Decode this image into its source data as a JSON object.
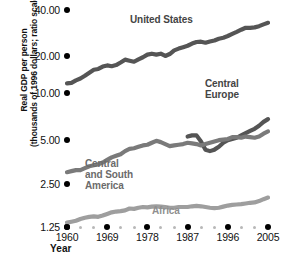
{
  "chart_data": {
    "type": "line",
    "title": "",
    "xlabel": "Year",
    "ylabel_line1": "Real GDP per person",
    "ylabel_line2": "(thousands of 1996 dollars; ratio scale)",
    "yscale": "log",
    "ylim": [
      1.25,
      45.0
    ],
    "xlim": [
      1960,
      2005
    ],
    "yticks": [
      40.0,
      20.0,
      10.0,
      5.0,
      2.5,
      1.25
    ],
    "ytick_labels": [
      "40.00",
      "20.00",
      "10.00",
      "5.00",
      "2.50",
      "1.25"
    ],
    "xticks_major": [
      1960,
      1969,
      1978,
      1987,
      1996,
      2005
    ],
    "xtick_labels": [
      "1960",
      "1969",
      "1978",
      "1987",
      "1996",
      "2005"
    ],
    "xticks_minor_per_interval": 2,
    "grid": false,
    "legend": "inline-annotations",
    "series": [
      {
        "name": "United States",
        "color": "#555555",
        "label_x": 1978,
        "label_y": 30.0,
        "x": [
          1960,
          1961,
          1962,
          1963,
          1964,
          1965,
          1966,
          1967,
          1968,
          1969,
          1970,
          1971,
          1972,
          1973,
          1974,
          1975,
          1976,
          1977,
          1978,
          1979,
          1980,
          1981,
          1982,
          1983,
          1984,
          1985,
          1986,
          1987,
          1988,
          1989,
          1990,
          1991,
          1992,
          1993,
          1994,
          1995,
          1996,
          1997,
          1998,
          1999,
          2000,
          2001,
          2002,
          2003,
          2004,
          2005
        ],
        "values": [
          12.4,
          12.5,
          13.0,
          13.4,
          14.0,
          14.7,
          15.4,
          15.6,
          16.2,
          16.5,
          16.3,
          16.6,
          17.3,
          18.1,
          17.8,
          17.5,
          18.2,
          18.8,
          19.6,
          19.9,
          19.6,
          19.9,
          19.2,
          19.8,
          21.0,
          21.6,
          22.1,
          22.6,
          23.4,
          24.0,
          24.1,
          23.7,
          24.2,
          24.6,
          25.3,
          25.7,
          26.4,
          27.3,
          28.2,
          29.2,
          30.1,
          30.1,
          30.3,
          30.9,
          31.8,
          32.6
        ]
      },
      {
        "name": "Central Europe",
        "color": "#555555",
        "label_x": 1990,
        "label_y": 9.2,
        "x": [
          1987,
          1988,
          1989,
          1990,
          1991,
          1992,
          1993,
          1994,
          1995,
          1996,
          1997,
          1998,
          1999,
          2000,
          2001,
          2002,
          2003,
          2004,
          2005
        ],
        "values": [
          5.3,
          5.4,
          5.4,
          4.9,
          4.3,
          4.2,
          4.3,
          4.5,
          4.8,
          5.0,
          5.1,
          5.2,
          5.4,
          5.6,
          5.8,
          6.0,
          6.3,
          6.7,
          7.0
        ]
      },
      {
        "name": "Central and South America",
        "color": "#7a7a7a",
        "label_x": 1968,
        "label_y": 3.1,
        "x": [
          1960,
          1961,
          1962,
          1963,
          1964,
          1965,
          1966,
          1967,
          1968,
          1969,
          1970,
          1971,
          1972,
          1973,
          1974,
          1975,
          1976,
          1977,
          1978,
          1979,
          1980,
          1981,
          1982,
          1983,
          1984,
          1985,
          1986,
          1987,
          1988,
          1989,
          1990,
          1991,
          1992,
          1993,
          1994,
          1995,
          1996,
          1997,
          1998,
          1999,
          2000,
          2001,
          2002,
          2003,
          2004,
          2005
        ],
        "values": [
          3.0,
          3.05,
          3.1,
          3.1,
          3.2,
          3.3,
          3.35,
          3.4,
          3.5,
          3.65,
          3.8,
          3.9,
          4.0,
          4.2,
          4.35,
          4.4,
          4.5,
          4.6,
          4.65,
          4.8,
          4.95,
          4.85,
          4.7,
          4.55,
          4.6,
          4.65,
          4.7,
          4.8,
          4.75,
          4.7,
          4.6,
          4.7,
          4.8,
          4.9,
          5.0,
          5.05,
          5.1,
          5.25,
          5.25,
          5.2,
          5.3,
          5.25,
          5.2,
          5.3,
          5.55,
          5.75
        ]
      },
      {
        "name": "Africa",
        "color": "#9e9e9e",
        "label_x": 1985,
        "label_y": 1.52,
        "x": [
          1960,
          1961,
          1962,
          1963,
          1964,
          1965,
          1966,
          1967,
          1968,
          1969,
          1970,
          1971,
          1972,
          1973,
          1974,
          1975,
          1976,
          1977,
          1978,
          1979,
          1980,
          1981,
          1982,
          1983,
          1984,
          1985,
          1986,
          1987,
          1988,
          1989,
          1990,
          1991,
          1992,
          1993,
          1994,
          1995,
          1996,
          1997,
          1998,
          1999,
          2000,
          2001,
          2002,
          2003,
          2004,
          2005
        ],
        "values": [
          1.34,
          1.36,
          1.38,
          1.42,
          1.45,
          1.47,
          1.48,
          1.47,
          1.5,
          1.54,
          1.58,
          1.6,
          1.61,
          1.63,
          1.68,
          1.67,
          1.7,
          1.72,
          1.71,
          1.73,
          1.74,
          1.73,
          1.72,
          1.7,
          1.7,
          1.72,
          1.72,
          1.72,
          1.74,
          1.75,
          1.74,
          1.72,
          1.7,
          1.69,
          1.7,
          1.73,
          1.76,
          1.78,
          1.79,
          1.8,
          1.82,
          1.84,
          1.85,
          1.89,
          1.95,
          2.0
        ]
      }
    ]
  },
  "annotations": {
    "united_states": "United States",
    "central_europe_line1": "Central",
    "central_europe_line2": "Europe",
    "central_south_line1": "Central",
    "central_south_line2": "and South",
    "central_south_line3": "America",
    "africa": "Africa"
  },
  "colors": {
    "dark_line": "#555555",
    "mid_line": "#7a7a7a",
    "light_line": "#9e9e9e",
    "tick_dot": "#000000",
    "minor_dot": "#b8b8b8",
    "text": "#111111"
  }
}
